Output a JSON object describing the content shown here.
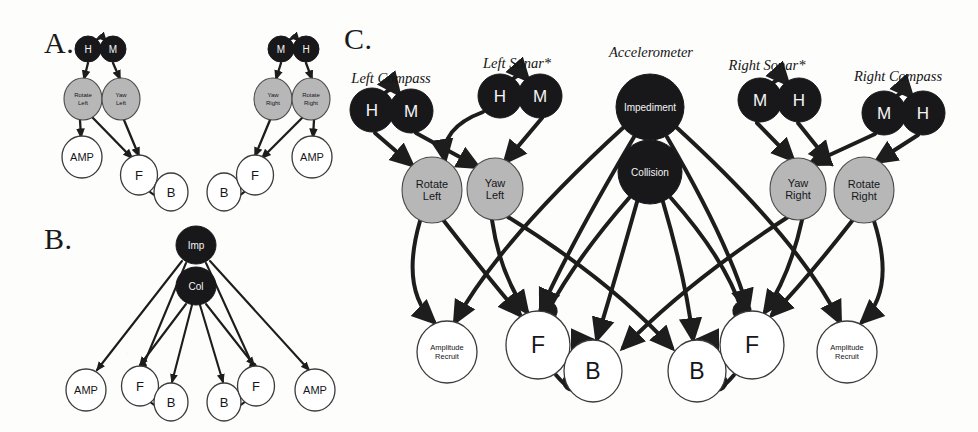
{
  "figure": {
    "background": "#fdfdfc",
    "colors": {
      "dark_node": "#18181b",
      "gray_node": "#b7b7b7",
      "white_node": "#ffffff",
      "edge": "#1d1d1d",
      "dark_node_text": "#f4f4f4",
      "light_node_text": "#16161a"
    }
  },
  "panels": [
    {
      "id": "A",
      "label": "A.",
      "x": 44,
      "y": 26
    },
    {
      "id": "B",
      "label": "B.",
      "x": 44,
      "y": 222
    },
    {
      "id": "C",
      "label": "C.",
      "x": 344,
      "y": 22
    }
  ],
  "panel_a": {
    "nodes": [
      {
        "name": "left-compass-h",
        "label": "H",
        "cx": 88,
        "cy": 49,
        "rx": 13,
        "ry": 13,
        "style": "dark",
        "font": 10
      },
      {
        "name": "left-compass-m",
        "label": "M",
        "cx": 113,
        "cy": 49,
        "rx": 13,
        "ry": 13,
        "style": "dark",
        "font": 10
      },
      {
        "name": "rotate-left",
        "label": "Rotate\nLeft",
        "cx": 83,
        "cy": 99,
        "rx": 19,
        "ry": 21,
        "style": "gray",
        "font": 6
      },
      {
        "name": "yaw-left",
        "label": "Yaw\nLeft",
        "cx": 121,
        "cy": 99,
        "rx": 19,
        "ry": 21,
        "style": "gray",
        "font": 6
      },
      {
        "name": "amp-left",
        "label": "AMP",
        "cx": 82,
        "cy": 157,
        "rx": 20,
        "ry": 21,
        "style": "white",
        "font": 11
      },
      {
        "name": "f-left",
        "label": "F",
        "cx": 139,
        "cy": 175,
        "rx": 18.5,
        "ry": 20,
        "style": "white",
        "font": 13
      },
      {
        "name": "b-left",
        "label": "B",
        "cx": 171,
        "cy": 192,
        "rx": 17,
        "ry": 19,
        "style": "white",
        "font": 13
      },
      {
        "name": "b-right",
        "label": "B",
        "cx": 224,
        "cy": 192,
        "rx": 17,
        "ry": 19,
        "style": "white",
        "font": 13
      },
      {
        "name": "f-right",
        "label": "F",
        "cx": 255,
        "cy": 175,
        "rx": 18.5,
        "ry": 20,
        "style": "white",
        "font": 13
      },
      {
        "name": "amp-right",
        "label": "AMP",
        "cx": 312,
        "cy": 157,
        "rx": 20,
        "ry": 21,
        "style": "white",
        "font": 11
      },
      {
        "name": "yaw-right",
        "label": "Yaw\nRight",
        "cx": 273,
        "cy": 99,
        "rx": 19,
        "ry": 21,
        "style": "gray",
        "font": 6
      },
      {
        "name": "rotate-right",
        "label": "Rotate\nRight",
        "cx": 311,
        "cy": 99,
        "rx": 19,
        "ry": 21,
        "style": "gray",
        "font": 6
      },
      {
        "name": "right-compass-m",
        "label": "M",
        "cx": 281,
        "cy": 49,
        "rx": 13,
        "ry": 13,
        "style": "dark",
        "font": 10
      },
      {
        "name": "right-compass-h",
        "label": "H",
        "cx": 306,
        "cy": 49,
        "rx": 13,
        "ry": 13,
        "style": "dark",
        "font": 10
      }
    ]
  },
  "panel_b": {
    "nodes": [
      {
        "name": "impediment-short",
        "label": "Imp",
        "cx": 196,
        "cy": 245,
        "rx": 20,
        "ry": 19,
        "style": "dark",
        "font": 10
      },
      {
        "name": "collision-short",
        "label": "Col",
        "cx": 196,
        "cy": 286,
        "rx": 20,
        "ry": 19,
        "style": "dark",
        "font": 10
      },
      {
        "name": "amp-left-b",
        "label": "AMP",
        "cx": 86,
        "cy": 390,
        "rx": 20,
        "ry": 21,
        "style": "white",
        "font": 11
      },
      {
        "name": "f-left-b",
        "label": "F",
        "cx": 140,
        "cy": 386,
        "rx": 18.5,
        "ry": 20,
        "style": "white",
        "font": 13
      },
      {
        "name": "b-left-b",
        "label": "B",
        "cx": 171,
        "cy": 402,
        "rx": 17,
        "ry": 19,
        "style": "white",
        "font": 13
      },
      {
        "name": "b-right-b",
        "label": "B",
        "cx": 224,
        "cy": 402,
        "rx": 17,
        "ry": 19,
        "style": "white",
        "font": 13
      },
      {
        "name": "f-right-b",
        "label": "F",
        "cx": 256,
        "cy": 386,
        "rx": 18.5,
        "ry": 20,
        "style": "white",
        "font": 13
      },
      {
        "name": "amp-right-b",
        "label": "AMP",
        "cx": 315,
        "cy": 390,
        "rx": 20,
        "ry": 21,
        "style": "white",
        "font": 11
      }
    ]
  },
  "panel_c": {
    "sensor_labels": [
      {
        "name": "left-compass-label",
        "text": "Left Compass",
        "x": 391,
        "y": 70
      },
      {
        "name": "left-sonar-label",
        "text": "Left Sonar*",
        "x": 517,
        "y": 55
      },
      {
        "name": "accelerometer-label",
        "text": "Accelerometer",
        "x": 651,
        "y": 44
      },
      {
        "name": "right-sonar-label",
        "text": "Right Sonar*",
        "x": 767,
        "y": 57
      },
      {
        "name": "right-compass-label",
        "text": "Right Compass",
        "x": 898,
        "y": 68
      }
    ],
    "nodes": [
      {
        "name": "left-compass-h",
        "label": "H",
        "cx": 372,
        "cy": 110,
        "rx": 22,
        "ry": 22,
        "style": "dark",
        "font": 17
      },
      {
        "name": "left-compass-m",
        "label": "M",
        "cx": 411,
        "cy": 111,
        "rx": 22,
        "ry": 22,
        "style": "dark",
        "font": 17
      },
      {
        "name": "left-sonar-h",
        "label": "H",
        "cx": 500,
        "cy": 96,
        "rx": 22,
        "ry": 22,
        "style": "dark",
        "font": 17
      },
      {
        "name": "left-sonar-m",
        "label": "M",
        "cx": 540,
        "cy": 96,
        "rx": 22,
        "ry": 22,
        "style": "dark",
        "font": 17
      },
      {
        "name": "impediment",
        "label": "Impediment",
        "cx": 650,
        "cy": 107,
        "rx": 34,
        "ry": 33,
        "style": "dark",
        "font": 10
      },
      {
        "name": "collision",
        "label": "Collision",
        "cx": 650,
        "cy": 172,
        "rx": 32,
        "ry": 32,
        "style": "dark",
        "font": 10
      },
      {
        "name": "right-sonar-m",
        "label": "M",
        "cx": 760,
        "cy": 100,
        "rx": 22,
        "ry": 22,
        "style": "dark",
        "font": 17
      },
      {
        "name": "right-sonar-h",
        "label": "H",
        "cx": 799,
        "cy": 100,
        "rx": 22,
        "ry": 22,
        "style": "dark",
        "font": 17
      },
      {
        "name": "right-compass-m",
        "label": "M",
        "cx": 884,
        "cy": 113,
        "rx": 22,
        "ry": 22,
        "style": "dark",
        "font": 17
      },
      {
        "name": "right-compass-h",
        "label": "H",
        "cx": 923,
        "cy": 113,
        "rx": 22,
        "ry": 22,
        "style": "dark",
        "font": 17
      },
      {
        "name": "rotate-left",
        "label": "Rotate\nLeft",
        "cx": 432,
        "cy": 190,
        "rx": 30,
        "ry": 33,
        "style": "gray",
        "font": 11
      },
      {
        "name": "yaw-left",
        "label": "Yaw\nLeft",
        "cx": 495,
        "cy": 189,
        "rx": 28,
        "ry": 31,
        "style": "gray",
        "font": 11
      },
      {
        "name": "yaw-right",
        "label": "Yaw\nRight",
        "cx": 798,
        "cy": 189,
        "rx": 28,
        "ry": 31,
        "style": "gray",
        "font": 11
      },
      {
        "name": "rotate-right",
        "label": "Rotate\nRight",
        "cx": 864,
        "cy": 190,
        "rx": 30,
        "ry": 33,
        "style": "gray",
        "font": 11
      },
      {
        "name": "amplitude-recruit-left",
        "label": "Amplitude\nRecruit",
        "cx": 447,
        "cy": 352,
        "rx": 30,
        "ry": 31,
        "style": "white",
        "font": 7.5
      },
      {
        "name": "f-left",
        "label": "F",
        "cx": 538,
        "cy": 345,
        "rx": 32,
        "ry": 34,
        "style": "white",
        "font": 23
      },
      {
        "name": "b-left",
        "label": "B",
        "cx": 593,
        "cy": 371,
        "rx": 29,
        "ry": 31,
        "style": "white",
        "font": 23
      },
      {
        "name": "b-right",
        "label": "B",
        "cx": 697,
        "cy": 371,
        "rx": 29,
        "ry": 31,
        "style": "white",
        "font": 23
      },
      {
        "name": "f-right",
        "label": "F",
        "cx": 752,
        "cy": 345,
        "rx": 32,
        "ry": 34,
        "style": "white",
        "font": 23
      },
      {
        "name": "amplitude-recruit-right",
        "label": "Amplitude\nRecruit",
        "cx": 847,
        "cy": 352,
        "rx": 30,
        "ry": 31,
        "style": "white",
        "font": 7.5
      }
    ]
  },
  "graph_edges": {
    "description": "Edges carry either an arrowhead terminal (excitatory) or a filled round terminal (inhibitory)."
  }
}
